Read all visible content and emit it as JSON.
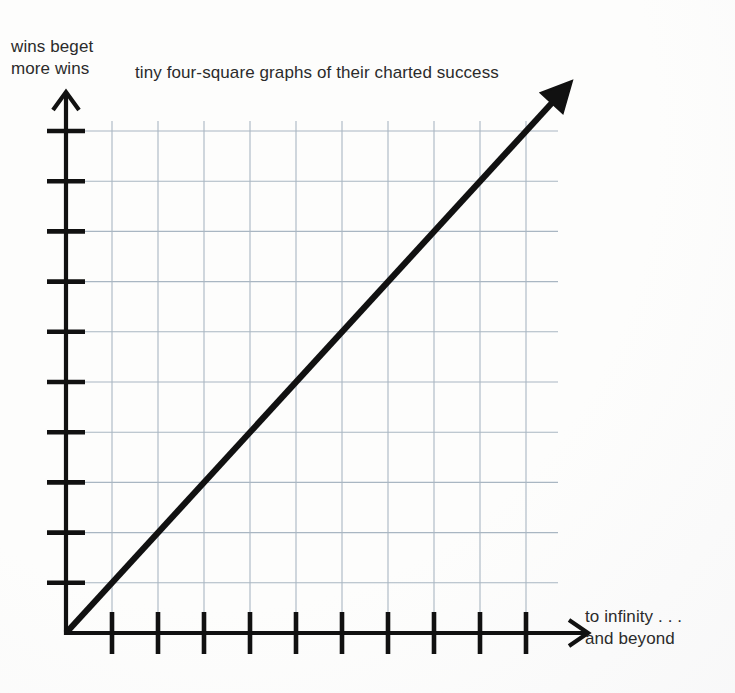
{
  "chart_data": {
    "type": "line",
    "title": "tiny four-square graphs of their charted success",
    "ylabel": "wins beget\nmore wins",
    "xlabel": "to infinity . . .\nand beyond",
    "grid": true,
    "legend": "none",
    "axis_style": "arrow-terminated",
    "x_tick_count": 10,
    "y_tick_count": 10,
    "x_tick_labels": [
      "",
      "",
      "",
      "",
      "",
      "",
      "",
      "",
      "",
      ""
    ],
    "y_tick_labels": [
      "",
      "",
      "",
      "",
      "",
      "",
      "",
      "",
      "",
      ""
    ],
    "xlim": [
      0,
      11
    ],
    "ylim": [
      0,
      11
    ],
    "series": [
      {
        "name": "charted success",
        "x": [
          0,
          11
        ],
        "y": [
          0,
          11
        ],
        "style": "solid",
        "arrow_end": true,
        "color": "#111111"
      }
    ],
    "annotations": [
      {
        "name": "origin",
        "x": 0,
        "y": 0
      }
    ],
    "colors": {
      "line": "#111111",
      "axis": "#111111",
      "grid": "#a9b6c2",
      "text": "#2b2b2b",
      "background": "#fdfdfc"
    }
  },
  "labels": {
    "y_axis_text_line1": "wins beget",
    "y_axis_text_line2": "more wins",
    "title": "tiny four-square graphs of their charted success",
    "x_axis_text_line1": "to infinity . . .",
    "x_axis_text_line2": "and beyond"
  },
  "icons": {
    "y_axis_arrow": "arrow-up-icon",
    "x_axis_arrow": "arrow-right-icon",
    "trend_arrow": "arrow-up-right-icon"
  }
}
